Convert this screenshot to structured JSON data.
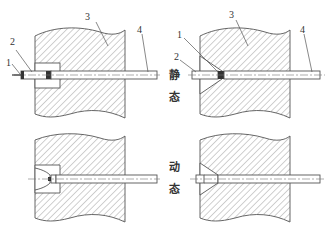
{
  "diagram": {
    "type": "mechanical-cross-section",
    "panels": [
      {
        "id": "static-counterbore",
        "row": "static",
        "col": "left",
        "labels": [
          "1",
          "2",
          "3",
          "4"
        ]
      },
      {
        "id": "static-countersink",
        "row": "static",
        "col": "right",
        "labels": [
          "1",
          "2",
          "3",
          "4"
        ]
      },
      {
        "id": "dynamic-counterbore",
        "row": "dynamic",
        "col": "left",
        "labels": []
      },
      {
        "id": "dynamic-countersink",
        "row": "dynamic",
        "col": "right",
        "labels": []
      }
    ],
    "part_labels": {
      "p1": "1",
      "p2": "2",
      "p3": "3",
      "p4": "4"
    },
    "state_labels": {
      "static_char1": "静",
      "static_char2": "态",
      "dynamic_char1": "动",
      "dynamic_char2": "态"
    },
    "colors": {
      "line": "#555555",
      "hatch": "#777777",
      "background": "#ffffff"
    }
  }
}
